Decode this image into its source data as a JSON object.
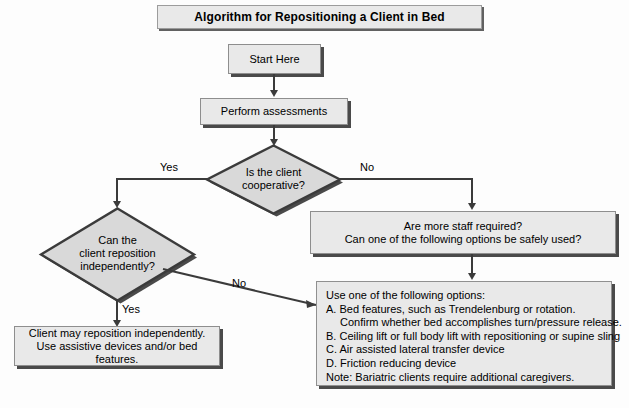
{
  "title": {
    "text": "Algorithm for Repositioning a Client in Bed"
  },
  "nodes": {
    "start": {
      "label": "Start Here"
    },
    "assess": {
      "label": "Perform assessments"
    },
    "decision_cooperative": {
      "label": "Is the client\ncooperative?"
    },
    "decision_independent": {
      "label": "Can the\nclient reposition\nindependently?"
    },
    "staff_box": {
      "label": "Are more staff required?\nCan one of the following options be safely used?"
    },
    "independent_result": {
      "label": "Client may reposition independently.\nUse assistive devices and/or bed features."
    }
  },
  "options_box": {
    "heading": "Use one of the following options:",
    "lines": [
      "A. Bed features, such as Trendelenburg or rotation.",
      "Confirm whether bed accomplishes turn/pressure release.",
      "B. Ceiling lift or full body lift with repositioning or supine sling",
      "C. Air assisted lateral transfer device",
      "D. Friction reducing device",
      "Note: Bariatric clients require additional caregivers."
    ]
  },
  "edge_labels": {
    "cooperative_yes": "Yes",
    "cooperative_no": "No",
    "independent_no": "No",
    "independent_yes": "Yes"
  },
  "colors": {
    "node_fill": "#e9e9e9",
    "node_border": "#9a9a9a",
    "shadow": "#4a4a4a",
    "connector": "#3b3b3b",
    "background": "#fdfdfd",
    "text": "#000000"
  }
}
